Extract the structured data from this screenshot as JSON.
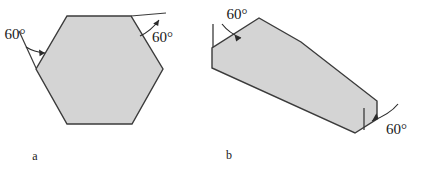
{
  "figure": {
    "background_color": "#ffffff",
    "shape_fill_color": "#d4d4d4",
    "shape_stroke_color": "#3b3b3b",
    "panels": [
      {
        "id": "a",
        "label": "a",
        "shape_name": "regular-hexagon",
        "annotations": [
          {
            "id": "a-left",
            "text": "60°"
          },
          {
            "id": "a-right",
            "text": "60°"
          }
        ]
      },
      {
        "id": "b",
        "label": "b",
        "shape_name": "elongated-sheared-hexagon",
        "annotations": [
          {
            "id": "b-left",
            "text": "60°"
          },
          {
            "id": "b-right",
            "text": "60°"
          }
        ]
      }
    ]
  }
}
